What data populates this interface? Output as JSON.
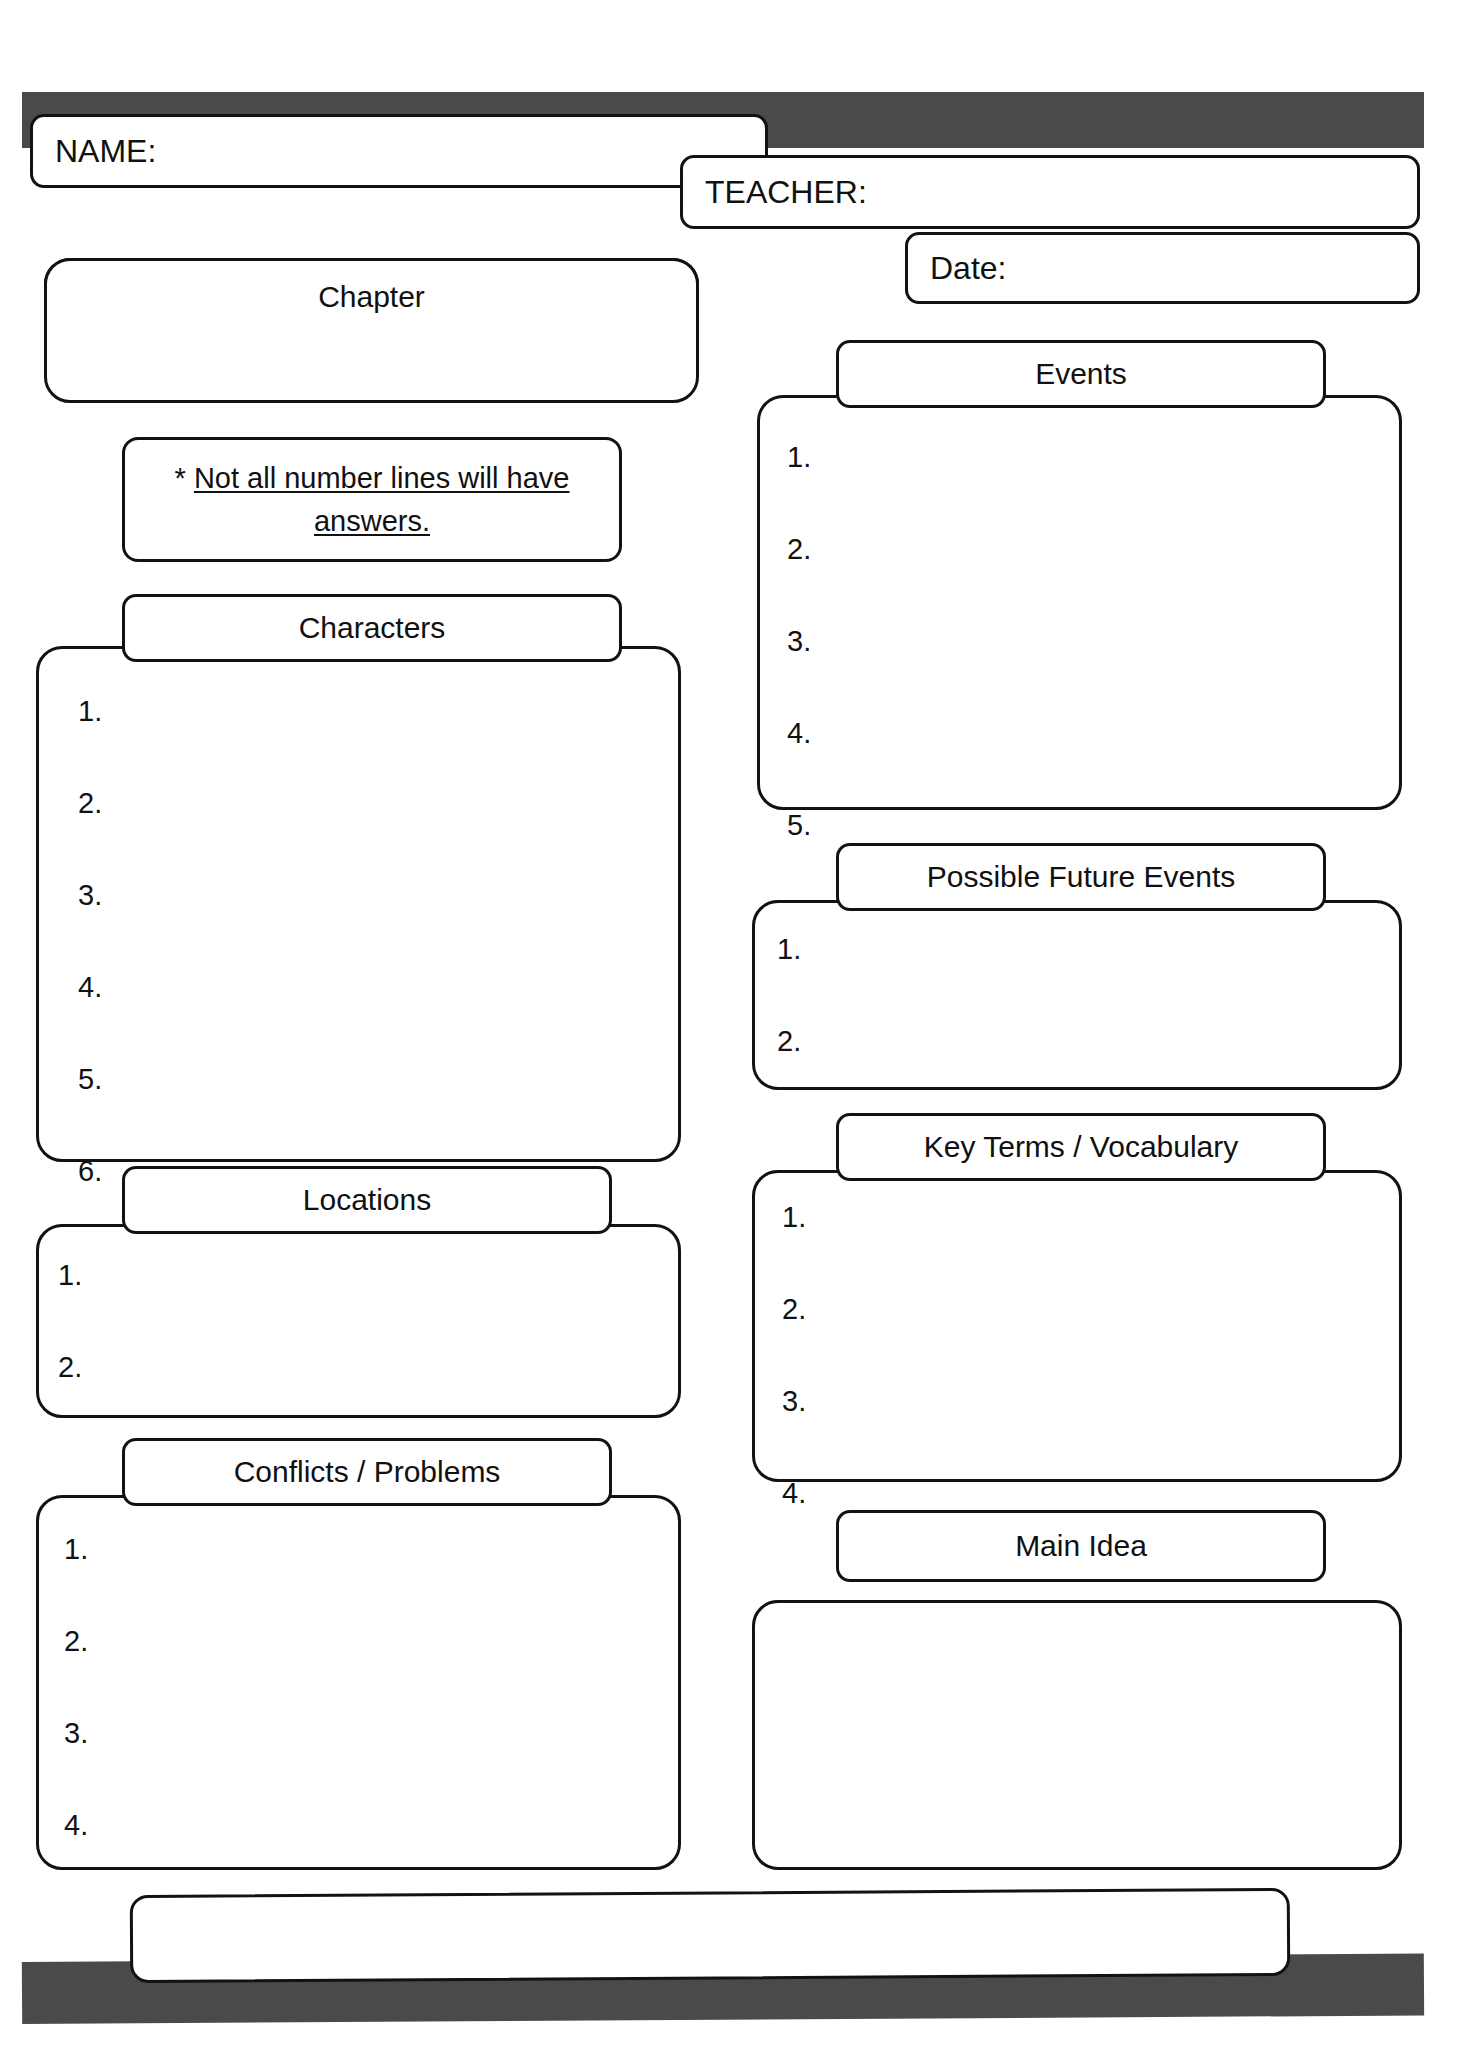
{
  "worksheet": {
    "title_note": "* Not all number lines will have answers.",
    "note_asterisk": "*",
    "note_underlined": "Not all number lines will have answers."
  },
  "fields": {
    "name_label": "NAME:",
    "teacher_label": "TEACHER:",
    "date_label": "Date:"
  },
  "sections": {
    "chapter": {
      "header": "Chapter",
      "items": []
    },
    "characters": {
      "header": "Characters",
      "items": [
        "1.",
        "2.",
        "3.",
        "4.",
        "5.",
        "6."
      ]
    },
    "locations": {
      "header": "Locations",
      "items": [
        "1.",
        "2."
      ]
    },
    "conflicts": {
      "header": "Conflicts / Problems",
      "items": [
        "1.",
        "2.",
        "3.",
        "4."
      ]
    },
    "events": {
      "header": "Events",
      "items": [
        "1.",
        "2.",
        "3.",
        "4.",
        "5."
      ]
    },
    "future_events": {
      "header": "Possible Future Events",
      "items": [
        "1.",
        "2."
      ]
    },
    "key_terms": {
      "header": "Key Terms / Vocabulary",
      "items": [
        "1.",
        "2.",
        "3.",
        "4."
      ]
    },
    "main_idea": {
      "header": "Main Idea",
      "items": []
    },
    "footer": {
      "header": "",
      "items": []
    }
  },
  "colors": {
    "bar": "#4a4a4a",
    "outline": "#121212",
    "paper": "#ffffff",
    "ink": "#111111"
  }
}
